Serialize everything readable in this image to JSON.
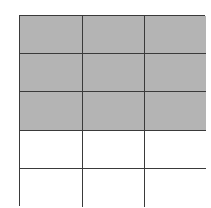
{
  "diagram": {
    "type": "fraction-grid",
    "rows": 5,
    "columns": 3,
    "shaded_rows": 3,
    "total_cells": 15,
    "shaded_cells": 9,
    "colors": {
      "shaded": "#b4b4b4",
      "unshaded": "#ffffff",
      "line": "#3a3a3a"
    },
    "cells": [
      [
        "shaded",
        "shaded",
        "shaded"
      ],
      [
        "shaded",
        "shaded",
        "shaded"
      ],
      [
        "shaded",
        "shaded",
        "shaded"
      ],
      [
        "unshaded",
        "unshaded",
        "unshaded"
      ],
      [
        "unshaded",
        "unshaded",
        "unshaded"
      ]
    ]
  }
}
